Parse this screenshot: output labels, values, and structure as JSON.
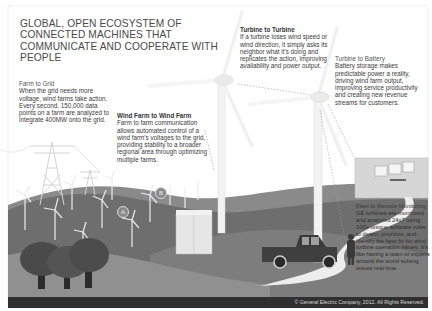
{
  "infographic": {
    "title": "GLOBAL, OPEN ECOSYSTEM OF CONNECTED MACHINES THAT COMMUNICATE AND COOPERATE WITH PEOPLE",
    "callouts": {
      "farm_to_grid": {
        "heading": "Farm to Grid",
        "body": "When the grid needs more voltage, wind farms take action. Every second, 150,000 data points on a farm are analyzed to integrate 400MW onto the grid."
      },
      "wind_farm_to_wind_farm": {
        "heading": "Wind Farm to Wind Farm",
        "body": "Farm to farm communication allows automated control of a wind farm's voltages to the grid, providing stability to a broader regional area through optimizing multiple farms."
      },
      "turbine_to_turbine": {
        "heading": "Turbine to Turbine",
        "body": "If a turbine loses wind speed or wind direction, it simply asks its neighbor what it's doing and replicates the action, improving availability and power output."
      },
      "turbine_to_battery": {
        "heading": "Turbine to Battery",
        "body": "Battery storage makes predictable power a reality, driving wind farm output, improving service productivity and creating new revenue streams for customers."
      },
      "fleet_remote_monitoring": {
        "heading": "Fleet to Remote Monitoring",
        "body": "GE turbines are monitored and analyzed 24x7 using 100+ unique software rules to detect, prioritize, and identify the best fix for wind turbine operation issues. It's like having a team of experts around the world solving issues real time."
      }
    },
    "markers": {
      "a": "A",
      "b": "B"
    },
    "footer": "© General Electric Company, 2012. All Rights Reserved."
  },
  "colors": {
    "background": "#ffffff",
    "hill_dark": "#5e5e5e",
    "hill_mid": "#7a7a7a",
    "hill_light": "#9a9a9a",
    "footer_bg": "#2f2f2f",
    "text": "#3a3a3a"
  }
}
